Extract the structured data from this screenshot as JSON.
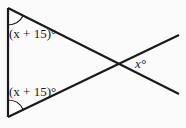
{
  "diagram": {
    "type": "geometry-angle-figure",
    "labels": {
      "top_angle": "(x + 15)°",
      "bottom_angle": "(x + 15)°",
      "vertical_angle": "x°"
    },
    "colors": {
      "background": "#fbfbfb",
      "stroke": "#1a1a1a"
    }
  }
}
